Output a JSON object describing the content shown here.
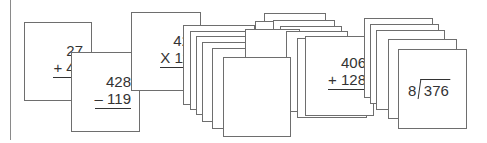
{
  "cards": {
    "add1": {
      "top": "27",
      "op": "+ 48"
    },
    "sub1": {
      "top": "428",
      "op": "– 119"
    },
    "mul1": {
      "top": "42",
      "op": "X 11"
    },
    "add2": {
      "top": "406",
      "op": "+ 128"
    },
    "div1": {
      "divisor": "8",
      "dividend": "376"
    }
  },
  "colors": {
    "border": "#6e6e6e",
    "text": "#333333",
    "background": "#ffffff"
  }
}
